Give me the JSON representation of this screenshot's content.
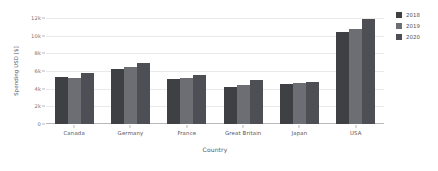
{
  "chart_data": {
    "type": "bar",
    "title": "",
    "subtitle": "",
    "xlabel": "Country",
    "ylabel": "Spending USD [$]",
    "categories": [
      "Canada",
      "Germany",
      "France",
      "Great Britain",
      "Japan",
      "USA"
    ],
    "series": [
      {
        "name": "2018",
        "color": "#3f4044",
        "values": [
          5300,
          6200,
          5100,
          4200,
          4500,
          10400
        ]
      },
      {
        "name": "2019",
        "color": "#6d6e73",
        "values": [
          5200,
          6400,
          5200,
          4400,
          4600,
          10800
        ]
      },
      {
        "name": "2020",
        "color": "#4e4f54",
        "values": [
          5800,
          6900,
          5500,
          5000,
          4700,
          11900
        ]
      }
    ],
    "ylim": [
      0,
      12000
    ],
    "ytick_values": [
      0,
      2000,
      4000,
      6000,
      8000,
      10000,
      12000
    ],
    "ytick_labels": [
      "0",
      "2k",
      "4k",
      "6k",
      "8k",
      "10k",
      "12k"
    ],
    "grid": true,
    "grid_axis": "y",
    "legend_position": "right",
    "background_color": "#ffffff",
    "grid_color": "#e9e9ec",
    "axis_color": "#b8b8bd",
    "text_color": "#55555d"
  }
}
